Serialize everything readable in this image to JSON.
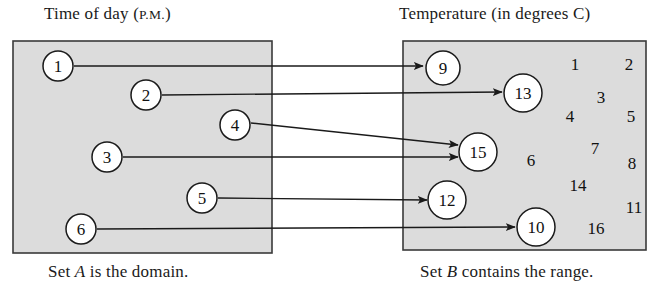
{
  "figure": {
    "type": "mapping-diagram",
    "title_left": "Time of day (",
    "title_left_smallcaps": "P.M.",
    "title_left_tail": ")",
    "title_right": "Temperature (in degrees C)",
    "footer_left_pre": "Set ",
    "footer_left_italic": "A",
    "footer_left_post": " is the domain.",
    "footer_right_pre": "Set ",
    "footer_right_italic": "B",
    "footer_right_post": " contains the range.",
    "box_fill": "#dcdcdc",
    "box_stroke": "#3a3a3a",
    "arrow_color": "#1a1a1a"
  },
  "set_a": {
    "name": "A",
    "label": "Time of day (P.M.)",
    "box": {
      "x": 13,
      "y": 41,
      "width": 259,
      "height": 212
    },
    "elements": [
      {
        "value": "1",
        "cx": 58,
        "cy": 66,
        "r": 15
      },
      {
        "value": "2",
        "cx": 146,
        "cy": 95,
        "r": 15
      },
      {
        "value": "4",
        "cx": 235,
        "cy": 125,
        "r": 15
      },
      {
        "value": "3",
        "cx": 107,
        "cy": 157,
        "r": 15
      },
      {
        "value": "5",
        "cx": 202,
        "cy": 198,
        "r": 15
      },
      {
        "value": "6",
        "cx": 81,
        "cy": 229,
        "r": 15
      }
    ]
  },
  "set_b": {
    "name": "B",
    "label": "Temperature (in degrees C)",
    "box": {
      "x": 403,
      "y": 41,
      "width": 243,
      "height": 209
    },
    "elements": [
      {
        "value": "9",
        "cx": 443,
        "cy": 68,
        "r": 17
      },
      {
        "value": "13",
        "cx": 523,
        "cy": 93,
        "r": 19
      },
      {
        "value": "15",
        "cx": 478,
        "cy": 152,
        "r": 19
      },
      {
        "value": "12",
        "cx": 447,
        "cy": 200,
        "r": 19
      },
      {
        "value": "10",
        "cx": 536,
        "cy": 227,
        "r": 19
      }
    ],
    "loose_numbers": [
      {
        "value": "1",
        "x": 575,
        "y": 64
      },
      {
        "value": "2",
        "x": 629,
        "y": 64
      },
      {
        "value": "3",
        "x": 601,
        "y": 97
      },
      {
        "value": "4",
        "x": 570,
        "y": 116
      },
      {
        "value": "5",
        "x": 631,
        "y": 116
      },
      {
        "value": "7",
        "x": 595,
        "y": 148
      },
      {
        "value": "6",
        "x": 531,
        "y": 160
      },
      {
        "value": "8",
        "x": 632,
        "y": 163
      },
      {
        "value": "14",
        "x": 578,
        "y": 185
      },
      {
        "value": "11",
        "x": 634,
        "y": 207
      },
      {
        "value": "16",
        "x": 596,
        "y": 228
      }
    ]
  },
  "mappings": [
    {
      "from": "1",
      "to": "9",
      "x1": 74,
      "y1": 66,
      "x2": 423,
      "y2": 66
    },
    {
      "from": "2",
      "to": "13",
      "x1": 162,
      "y1": 95,
      "x2": 502,
      "y2": 92
    },
    {
      "from": "4",
      "to": "15",
      "x1": 251,
      "y1": 123,
      "x2": 458,
      "y2": 145
    },
    {
      "from": "3",
      "to": "15",
      "x1": 123,
      "y1": 157,
      "x2": 458,
      "y2": 157
    },
    {
      "from": "5",
      "to": "12",
      "x1": 218,
      "y1": 198,
      "x2": 427,
      "y2": 200
    },
    {
      "from": "6",
      "to": "10",
      "x1": 97,
      "y1": 229,
      "x2": 515,
      "y2": 227
    }
  ]
}
